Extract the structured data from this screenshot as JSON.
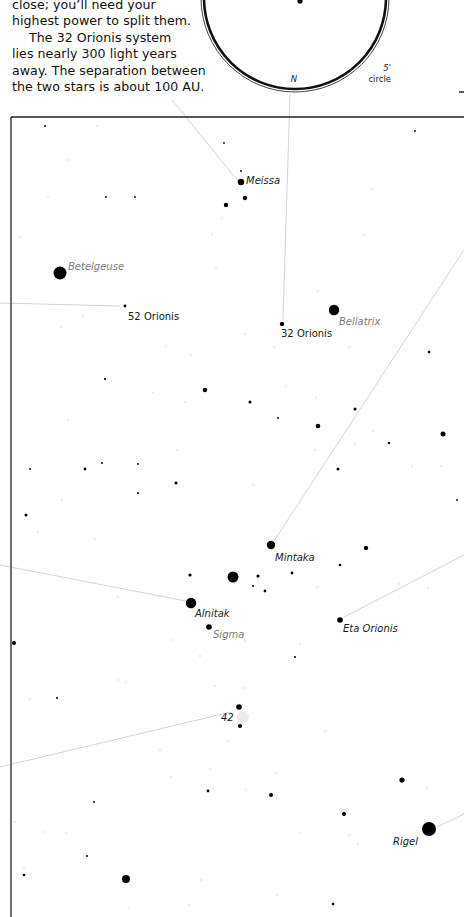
{
  "intro": {
    "lines": [
      {
        "text": "close; you’ll need your",
        "indent": false
      },
      {
        "text": "highest power to split them.",
        "indent": false
      },
      {
        "text": "The 32 Orionis system",
        "indent": true
      },
      {
        "text": "lies nearly 300 light years",
        "indent": false
      },
      {
        "text": "away. The separation between",
        "indent": false
      },
      {
        "text": "the two stars is about 100 AU.",
        "indent": false
      }
    ]
  },
  "eyepiece": {
    "north_label": "N",
    "field_label_1": "5'",
    "field_label_2": "circle"
  },
  "colors": {
    "frame": "#222222",
    "pointer_line": "#d4d4d4",
    "star": "#000000",
    "faint_star": "#cfcfcf",
    "label_gray": "#7a7a7a",
    "label_black": "#1a1a1a"
  },
  "labels": [
    {
      "id": "meissa",
      "text": "Meissa",
      "x": 246,
      "y": 184,
      "style": "black-italic"
    },
    {
      "id": "betelgeuse",
      "text": "Betelgeuse",
      "x": 68,
      "y": 270,
      "style": "gray-italic"
    },
    {
      "id": "52-orionis",
      "text": "52 Orionis",
      "x": 128,
      "y": 320,
      "style": "black"
    },
    {
      "id": "32-orionis",
      "text": "32 Orionis",
      "x": 281,
      "y": 337,
      "style": "black"
    },
    {
      "id": "bellatrix",
      "text": "Bellatrix",
      "x": 339,
      "y": 325,
      "style": "gray-italic"
    },
    {
      "id": "mintaka",
      "text": "Mintaka",
      "x": 275,
      "y": 561,
      "style": "black-italic"
    },
    {
      "id": "alnitak",
      "text": "Alnitak",
      "x": 195,
      "y": 617,
      "style": "black-italic"
    },
    {
      "id": "sigma",
      "text": "Sigma",
      "x": 213,
      "y": 638,
      "style": "gray-italic"
    },
    {
      "id": "eta-orionis",
      "text": "Eta Orionis",
      "x": 343,
      "y": 632,
      "style": "black-italic"
    },
    {
      "id": "m42",
      "text": "42",
      "x": 221,
      "y": 721,
      "style": "black-italic"
    },
    {
      "id": "rigel",
      "text": "Rigel",
      "x": 393,
      "y": 845,
      "style": "black-italic"
    }
  ],
  "stars": [
    {
      "x": 241,
      "y": 182,
      "r": 3.2
    },
    {
      "x": 245,
      "y": 198,
      "r": 2.2
    },
    {
      "x": 226,
      "y": 205,
      "r": 2.2
    },
    {
      "x": 60,
      "y": 273,
      "r": 6.5
    },
    {
      "x": 125,
      "y": 306,
      "r": 1.4
    },
    {
      "x": 282,
      "y": 324,
      "r": 2.2
    },
    {
      "x": 334,
      "y": 310,
      "r": 5.2
    },
    {
      "x": 205,
      "y": 390,
      "r": 2.3
    },
    {
      "x": 250,
      "y": 402,
      "r": 1.5
    },
    {
      "x": 318,
      "y": 426,
      "r": 2.3
    },
    {
      "x": 355,
      "y": 409,
      "r": 1.5
    },
    {
      "x": 443,
      "y": 434,
      "r": 2.5
    },
    {
      "x": 389,
      "y": 443,
      "r": 1.3
    },
    {
      "x": 105,
      "y": 379,
      "r": 1.1
    },
    {
      "x": 429,
      "y": 352,
      "r": 1.3
    },
    {
      "x": 278,
      "y": 418,
      "r": 1.0
    },
    {
      "x": 85,
      "y": 469,
      "r": 1.4
    },
    {
      "x": 102,
      "y": 463,
      "r": 1.0
    },
    {
      "x": 176,
      "y": 483,
      "r": 1.5
    },
    {
      "x": 338,
      "y": 469,
      "r": 1.5
    },
    {
      "x": 26,
      "y": 515,
      "r": 1.5
    },
    {
      "x": 138,
      "y": 493,
      "r": 1.0
    },
    {
      "x": 271,
      "y": 545,
      "r": 4.2
    },
    {
      "x": 366,
      "y": 548,
      "r": 2.2
    },
    {
      "x": 340,
      "y": 565,
      "r": 1.3
    },
    {
      "x": 233,
      "y": 577,
      "r": 5.5
    },
    {
      "x": 190,
      "y": 575,
      "r": 1.6
    },
    {
      "x": 258,
      "y": 576,
      "r": 1.6
    },
    {
      "x": 292,
      "y": 573,
      "r": 1.4
    },
    {
      "x": 253,
      "y": 586,
      "r": 1.0
    },
    {
      "x": 265,
      "y": 591,
      "r": 1.4
    },
    {
      "x": 191,
      "y": 603,
      "r": 5.2
    },
    {
      "x": 209,
      "y": 627,
      "r": 2.8
    },
    {
      "x": 340,
      "y": 620,
      "r": 2.8
    },
    {
      "x": 14,
      "y": 643,
      "r": 2.0
    },
    {
      "x": 295,
      "y": 657,
      "r": 1.0
    },
    {
      "x": 239,
      "y": 707,
      "r": 2.8
    },
    {
      "x": 240,
      "y": 726,
      "r": 2.1
    },
    {
      "x": 57,
      "y": 698,
      "r": 1.0
    },
    {
      "x": 402,
      "y": 780,
      "r": 2.6
    },
    {
      "x": 271,
      "y": 795,
      "r": 2.0
    },
    {
      "x": 208,
      "y": 791,
      "r": 1.4
    },
    {
      "x": 344,
      "y": 814,
      "r": 2.0
    },
    {
      "x": 94,
      "y": 802,
      "r": 1.0
    },
    {
      "x": 429,
      "y": 829,
      "r": 7.0
    },
    {
      "x": 87,
      "y": 856,
      "r": 1.0
    },
    {
      "x": 126,
      "y": 879,
      "r": 4.0
    },
    {
      "x": 24,
      "y": 875,
      "r": 1.3
    },
    {
      "x": 333,
      "y": 904,
      "r": 1.3
    },
    {
      "x": 45,
      "y": 126,
      "r": 0.9
    },
    {
      "x": 224,
      "y": 143,
      "r": 0.9
    },
    {
      "x": 241,
      "y": 171,
      "r": 0.9
    },
    {
      "x": 415,
      "y": 131,
      "r": 0.9
    },
    {
      "x": 106,
      "y": 197,
      "r": 0.9
    },
    {
      "x": 135,
      "y": 197,
      "r": 0.9
    },
    {
      "x": 457,
      "y": 500,
      "r": 0.9
    },
    {
      "x": 30,
      "y": 469,
      "r": 0.9
    },
    {
      "x": 138,
      "y": 464,
      "r": 0.9
    }
  ],
  "faint_stars": [
    {
      "x": 97,
      "y": 126
    },
    {
      "x": 68,
      "y": 160
    },
    {
      "x": 48,
      "y": 197
    },
    {
      "x": 222,
      "y": 218
    },
    {
      "x": 372,
      "y": 189
    },
    {
      "x": 20,
      "y": 237
    },
    {
      "x": 212,
      "y": 234
    },
    {
      "x": 364,
      "y": 235
    },
    {
      "x": 216,
      "y": 268
    },
    {
      "x": 83,
      "y": 316
    },
    {
      "x": 61,
      "y": 327
    },
    {
      "x": 245,
      "y": 334
    },
    {
      "x": 318,
      "y": 291
    },
    {
      "x": 349,
      "y": 347
    },
    {
      "x": 166,
      "y": 346
    },
    {
      "x": 191,
      "y": 355
    },
    {
      "x": 274,
      "y": 347
    },
    {
      "x": 153,
      "y": 393
    },
    {
      "x": 185,
      "y": 402
    },
    {
      "x": 68,
      "y": 420
    },
    {
      "x": 286,
      "y": 386
    },
    {
      "x": 316,
      "y": 398
    },
    {
      "x": 373,
      "y": 431
    },
    {
      "x": 355,
      "y": 444
    },
    {
      "x": 177,
      "y": 450
    },
    {
      "x": 253,
      "y": 485
    },
    {
      "x": 315,
      "y": 450
    },
    {
      "x": 412,
      "y": 466
    },
    {
      "x": 441,
      "y": 466
    },
    {
      "x": 62,
      "y": 500
    },
    {
      "x": 95,
      "y": 539
    },
    {
      "x": 38,
      "y": 532
    },
    {
      "x": 118,
      "y": 597
    },
    {
      "x": 173,
      "y": 640
    },
    {
      "x": 200,
      "y": 656
    },
    {
      "x": 317,
      "y": 587
    },
    {
      "x": 399,
      "y": 584
    },
    {
      "x": 428,
      "y": 588
    },
    {
      "x": 245,
      "y": 641
    },
    {
      "x": 300,
      "y": 644
    },
    {
      "x": 215,
      "y": 686
    },
    {
      "x": 244,
      "y": 688
    },
    {
      "x": 30,
      "y": 699
    },
    {
      "x": 118,
      "y": 680
    },
    {
      "x": 126,
      "y": 682
    },
    {
      "x": 228,
      "y": 741
    },
    {
      "x": 160,
      "y": 750
    },
    {
      "x": 325,
      "y": 731
    },
    {
      "x": 171,
      "y": 777
    },
    {
      "x": 210,
      "y": 769
    },
    {
      "x": 276,
      "y": 773
    },
    {
      "x": 246,
      "y": 790
    },
    {
      "x": 300,
      "y": 833
    },
    {
      "x": 349,
      "y": 835
    },
    {
      "x": 358,
      "y": 844
    },
    {
      "x": 427,
      "y": 788
    },
    {
      "x": 15,
      "y": 822
    },
    {
      "x": 43,
      "y": 832
    },
    {
      "x": 66,
      "y": 833
    },
    {
      "x": 201,
      "y": 880
    },
    {
      "x": 129,
      "y": 908
    },
    {
      "x": 189,
      "y": 905
    },
    {
      "x": 277,
      "y": 895
    },
    {
      "x": 24,
      "y": 868
    }
  ],
  "pointer_lines": [
    {
      "from": [
        172,
        100
      ],
      "to": [
        238,
        181
      ]
    },
    {
      "from": [
        290,
        94
      ],
      "to": [
        283,
        320
      ]
    },
    {
      "from": [
        0,
        303
      ],
      "to": [
        120,
        306
      ]
    },
    {
      "from": [
        464,
        250
      ],
      "to": [
        274,
        541
      ]
    },
    {
      "from": [
        0,
        565
      ],
      "to": [
        186,
        601
      ]
    },
    {
      "from": [
        464,
        555
      ],
      "to": [
        344,
        617
      ]
    },
    {
      "from": [
        0,
        767
      ],
      "to": [
        231,
        712
      ]
    },
    {
      "from": [
        464,
        814
      ],
      "to": [
        437,
        827
      ]
    }
  ]
}
